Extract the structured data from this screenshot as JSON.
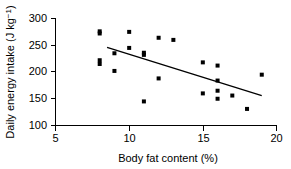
{
  "chart_data": {
    "type": "scatter",
    "title": "",
    "xlabel": "Body fat content (%)",
    "ylabel": "Daily energy intake (J kg⁻¹)",
    "ylabel_main": "Daily energy intake (J kg",
    "ylabel_sup": "−1",
    "ylabel_tail": ")",
    "xlim": [
      5,
      20
    ],
    "ylim": [
      100,
      300
    ],
    "grid": false,
    "legend": null,
    "xticks": [
      5,
      10,
      15,
      20
    ],
    "xticklabels": [
      "5",
      "10",
      "15",
      "20"
    ],
    "yticks": [
      100,
      150,
      200,
      250,
      300
    ],
    "yticklabels": [
      "100",
      "150",
      "200",
      "250",
      "300"
    ],
    "marker": "square",
    "marker_color": "#000000",
    "x": [
      8,
      8,
      8,
      8,
      9,
      9,
      10,
      10,
      11,
      11,
      11,
      12,
      12,
      13,
      15,
      15,
      16,
      16,
      16,
      16,
      17,
      18,
      19
    ],
    "y": [
      276,
      272,
      222,
      215,
      235,
      202,
      275,
      245,
      236,
      232,
      145,
      264,
      188,
      260,
      218,
      160,
      212,
      184,
      165,
      150,
      156,
      131,
      195
    ],
    "points": [
      {
        "x": 8,
        "y": 276
      },
      {
        "x": 8,
        "y": 272
      },
      {
        "x": 8,
        "y": 222
      },
      {
        "x": 8,
        "y": 215
      },
      {
        "x": 9,
        "y": 235
      },
      {
        "x": 9,
        "y": 202
      },
      {
        "x": 10,
        "y": 275
      },
      {
        "x": 10,
        "y": 245
      },
      {
        "x": 11,
        "y": 236
      },
      {
        "x": 11,
        "y": 232
      },
      {
        "x": 11,
        "y": 145
      },
      {
        "x": 12,
        "y": 264
      },
      {
        "x": 12,
        "y": 188
      },
      {
        "x": 13,
        "y": 260
      },
      {
        "x": 15,
        "y": 218
      },
      {
        "x": 15,
        "y": 160
      },
      {
        "x": 16,
        "y": 212
      },
      {
        "x": 16,
        "y": 184
      },
      {
        "x": 16,
        "y": 165
      },
      {
        "x": 16,
        "y": 150
      },
      {
        "x": 17,
        "y": 156
      },
      {
        "x": 18,
        "y": 131
      },
      {
        "x": 19,
        "y": 195
      }
    ],
    "fit_line": {
      "name": "regression line",
      "x_start": 8.5,
      "y_start": 246,
      "x_end": 19.0,
      "y_end": 156
    }
  }
}
